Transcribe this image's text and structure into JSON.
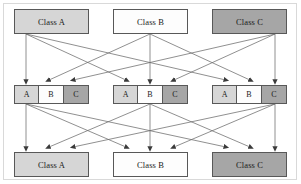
{
  "figure": {
    "width": 301,
    "height": 184
  },
  "colors": {
    "class_a_fill": "#d6d6d6",
    "class_b_fill": "#fdfdfd",
    "class_c_fill": "#a6a6a6",
    "stroke": "#585858",
    "edge": "#6b6b6b",
    "frame": "#d9d9d9",
    "text": "#1a1a1a"
  },
  "top_row": {
    "label": "source class boxes",
    "boxes": [
      {
        "key": "A",
        "label": "Class A",
        "shade": "sh-a",
        "x": 14,
        "y": 9,
        "w": 75,
        "h": 25
      },
      {
        "key": "B",
        "label": "Class B",
        "shade": "sh-b",
        "x": 113,
        "y": 9,
        "w": 75,
        "h": 25
      },
      {
        "key": "C",
        "label": "Class C",
        "shade": "sh-c",
        "x": 212,
        "y": 9,
        "w": 75,
        "h": 25
      }
    ]
  },
  "middle_row": {
    "label": "intermediate class-partition groups",
    "cell_labels": [
      "A",
      "B",
      "C"
    ],
    "cell_shades": [
      "sh-a",
      "sh-b",
      "sh-c"
    ],
    "groups": [
      {
        "key": "g1",
        "x": 14,
        "y": 85,
        "w": 75,
        "h": 19
      },
      {
        "key": "g2",
        "x": 113,
        "y": 85,
        "w": 75,
        "h": 19
      },
      {
        "key": "g3",
        "x": 212,
        "y": 85,
        "w": 75,
        "h": 19
      }
    ]
  },
  "bottom_row": {
    "label": "destination class boxes",
    "boxes": [
      {
        "key": "A",
        "label": "Class A",
        "shade": "sh-a",
        "x": 14,
        "y": 152,
        "w": 75,
        "h": 25
      },
      {
        "key": "B",
        "label": "Class B",
        "shade": "sh-b",
        "x": 113,
        "y": 152,
        "w": 75,
        "h": 25
      },
      {
        "key": "C",
        "label": "Class C",
        "shade": "sh-c",
        "x": 212,
        "y": 152,
        "w": 75,
        "h": 25
      }
    ]
  },
  "edges": {
    "upper": {
      "label": "top class boxes fan out to matching letter cell in every middle group",
      "sources": [
        {
          "from": "Class A",
          "x": 26,
          "y": 34
        },
        {
          "from": "Class B",
          "x": 150,
          "y": 34
        },
        {
          "from": "Class C",
          "x": 275,
          "y": 34
        }
      ],
      "targets": [
        {
          "group": 1,
          "cell": "A",
          "x": 26,
          "y": 85
        },
        {
          "group": 1,
          "cell": "B",
          "x": 50,
          "y": 85
        },
        {
          "group": 1,
          "cell": "C",
          "x": 75,
          "y": 85
        },
        {
          "group": 2,
          "cell": "A",
          "x": 125,
          "y": 85
        },
        {
          "group": 2,
          "cell": "B",
          "x": 150,
          "y": 85
        },
        {
          "group": 2,
          "cell": "C",
          "x": 175,
          "y": 85
        },
        {
          "group": 3,
          "cell": "A",
          "x": 224,
          "y": 85
        },
        {
          "group": 3,
          "cell": "B",
          "x": 249,
          "y": 85
        },
        {
          "group": 3,
          "cell": "C",
          "x": 275,
          "y": 85
        }
      ],
      "links": [
        {
          "from": "Class A",
          "to_group": 1,
          "to_cell": "A"
        },
        {
          "from": "Class A",
          "to_group": 2,
          "to_cell": "A"
        },
        {
          "from": "Class A",
          "to_group": 3,
          "to_cell": "A"
        },
        {
          "from": "Class B",
          "to_group": 1,
          "to_cell": "B"
        },
        {
          "from": "Class B",
          "to_group": 2,
          "to_cell": "B"
        },
        {
          "from": "Class B",
          "to_group": 3,
          "to_cell": "B"
        },
        {
          "from": "Class C",
          "to_group": 1,
          "to_cell": "C"
        },
        {
          "from": "Class C",
          "to_group": 2,
          "to_cell": "C"
        },
        {
          "from": "Class C",
          "to_group": 3,
          "to_cell": "C"
        }
      ]
    },
    "lower": {
      "label": "each middle group fans into all three bottom class boxes",
      "sources": [
        {
          "group": 1,
          "x": 26,
          "y": 104
        },
        {
          "group": 2,
          "x": 150,
          "y": 104
        },
        {
          "group": 3,
          "x": 275,
          "y": 104
        }
      ],
      "targets": [
        {
          "to": "Class A",
          "slot": 1,
          "x": 26,
          "y": 152
        },
        {
          "to": "Class A",
          "slot": 2,
          "x": 50,
          "y": 152
        },
        {
          "to": "Class A",
          "slot": 3,
          "x": 75,
          "y": 152
        },
        {
          "to": "Class B",
          "slot": 1,
          "x": 125,
          "y": 152
        },
        {
          "to": "Class B",
          "slot": 2,
          "x": 150,
          "y": 152
        },
        {
          "to": "Class B",
          "slot": 3,
          "x": 175,
          "y": 152
        },
        {
          "to": "Class C",
          "slot": 1,
          "x": 224,
          "y": 152
        },
        {
          "to": "Class C",
          "slot": 2,
          "x": 249,
          "y": 152
        },
        {
          "to": "Class C",
          "slot": 3,
          "x": 275,
          "y": 152
        }
      ],
      "links": [
        {
          "from_group": 1,
          "to": "Class A",
          "slot": 1
        },
        {
          "from_group": 1,
          "to": "Class B",
          "slot": 1
        },
        {
          "from_group": 1,
          "to": "Class C",
          "slot": 1
        },
        {
          "from_group": 2,
          "to": "Class A",
          "slot": 2
        },
        {
          "from_group": 2,
          "to": "Class B",
          "slot": 2
        },
        {
          "from_group": 2,
          "to": "Class C",
          "slot": 2
        },
        {
          "from_group": 3,
          "to": "Class A",
          "slot": 3
        },
        {
          "from_group": 3,
          "to": "Class B",
          "slot": 3
        },
        {
          "from_group": 3,
          "to": "Class C",
          "slot": 3
        }
      ]
    }
  }
}
